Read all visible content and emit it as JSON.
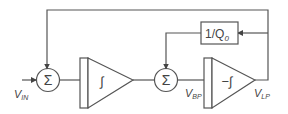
{
  "diagram": {
    "blocks": {
      "sum1": {
        "label": "Σ"
      },
      "integrator1": {
        "label": "∫"
      },
      "sum2": {
        "label": "Σ"
      },
      "integrator2": {
        "label": "−∫"
      },
      "gain": {
        "label": "1/Q",
        "label_sub": "0"
      }
    },
    "signals": {
      "input": {
        "label": "V",
        "sub": "IN"
      },
      "bandpass": {
        "label": "V",
        "sub": "BP"
      },
      "lowpass": {
        "label": "V",
        "sub": "LP"
      }
    },
    "colors": {
      "stroke": "#555555",
      "text": "#444444",
      "background": "#ffffff"
    }
  }
}
